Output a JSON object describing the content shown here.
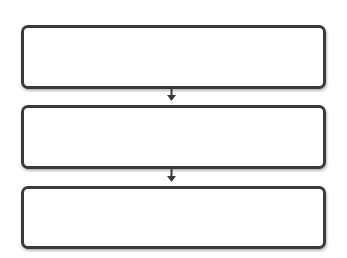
{
  "diagram": {
    "type": "vertical-flowchart",
    "boxes": [
      {
        "id": "step-1",
        "label": ""
      },
      {
        "id": "step-2",
        "label": ""
      },
      {
        "id": "step-3",
        "label": ""
      }
    ],
    "connectors": [
      {
        "from": "step-1",
        "to": "step-2",
        "style": "arrow-down"
      },
      {
        "from": "step-2",
        "to": "step-3",
        "style": "arrow-down"
      }
    ],
    "colors": {
      "border": "#3a3a3a",
      "fill": "#ffffff",
      "arrow": "#3a3a3a",
      "background": "#ffffff"
    }
  }
}
